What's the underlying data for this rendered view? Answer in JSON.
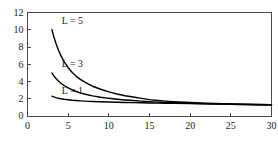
{
  "chart_data": {
    "type": "line",
    "title": "",
    "xlabel": "",
    "ylabel": "",
    "xlim": [
      0,
      30
    ],
    "ylim": [
      0,
      12
    ],
    "xticks": [
      0,
      5,
      10,
      15,
      20,
      25,
      30
    ],
    "yticks": [
      0,
      2,
      4,
      6,
      8,
      10,
      12
    ],
    "xtick_labels": [
      "0",
      "5",
      "10",
      "15",
      "20",
      "25",
      "30"
    ],
    "ytick_labels": [
      "0",
      "2",
      "4",
      "6",
      "8",
      "10",
      "12"
    ],
    "grid": false,
    "legend_position": "inline-left",
    "frame": "box",
    "line_color": "#000000",
    "axis_color": "#4a4a4a",
    "background": "#ffffff",
    "series": [
      {
        "name": "L = 5",
        "label": "L = 5",
        "label_x": 4.2,
        "label_y": 11.05,
        "x": [
          3.0,
          3.2,
          3.5,
          3.8,
          4.1,
          4.5,
          5.0,
          5.5,
          6.0,
          6.5,
          7.0,
          7.5,
          8.0,
          9.0,
          10.0,
          11.0,
          12.0,
          13.0,
          14.0,
          15.0,
          16.0,
          17.0,
          18.0,
          20.0,
          22.0,
          24.0,
          26.0,
          28.0,
          30.0
        ],
        "values": [
          10.0,
          9.3,
          8.4,
          7.65,
          7.0,
          6.3,
          5.6,
          5.05,
          4.6,
          4.25,
          3.95,
          3.7,
          3.45,
          3.1,
          2.8,
          2.55,
          2.35,
          2.2,
          2.05,
          1.9,
          1.8,
          1.72,
          1.66,
          1.56,
          1.48,
          1.42,
          1.38,
          1.34,
          1.3
        ]
      },
      {
        "name": "L = 3",
        "label": "L = 3",
        "label_x": 4.2,
        "label_y": 6.1,
        "x": [
          3.0,
          3.2,
          3.5,
          3.8,
          4.1,
          4.5,
          5.0,
          5.5,
          6.0,
          6.5,
          7.0,
          7.5,
          8.0,
          9.0,
          10.0,
          11.0,
          12.0,
          13.0,
          14.0,
          15.0,
          16.0,
          17.0,
          18.0,
          20.0,
          22.0,
          24.0,
          26.0,
          28.0,
          30.0
        ],
        "values": [
          5.0,
          4.7,
          4.35,
          4.05,
          3.8,
          3.52,
          3.25,
          3.02,
          2.84,
          2.68,
          2.55,
          2.44,
          2.34,
          2.18,
          2.05,
          1.95,
          1.86,
          1.79,
          1.72,
          1.66,
          1.61,
          1.57,
          1.53,
          1.47,
          1.42,
          1.38,
          1.34,
          1.31,
          1.28
        ]
      },
      {
        "name": "L = 1",
        "label": "L = 1",
        "label_x": 4.2,
        "label_y": 2.95,
        "x": [
          3.0,
          3.2,
          3.5,
          3.8,
          4.1,
          4.5,
          5.0,
          5.5,
          6.0,
          6.5,
          7.0,
          7.5,
          8.0,
          9.0,
          10.0,
          11.0,
          12.0,
          13.0,
          14.0,
          15.0,
          16.0,
          17.0,
          18.0,
          20.0,
          22.0,
          24.0,
          26.0,
          28.0,
          30.0
        ],
        "values": [
          2.3,
          2.22,
          2.13,
          2.06,
          2.0,
          1.94,
          1.88,
          1.83,
          1.79,
          1.755,
          1.725,
          1.7,
          1.68,
          1.645,
          1.615,
          1.59,
          1.57,
          1.55,
          1.53,
          1.51,
          1.49,
          1.475,
          1.46,
          1.435,
          1.41,
          1.385,
          1.36,
          1.335,
          1.31
        ]
      }
    ]
  }
}
